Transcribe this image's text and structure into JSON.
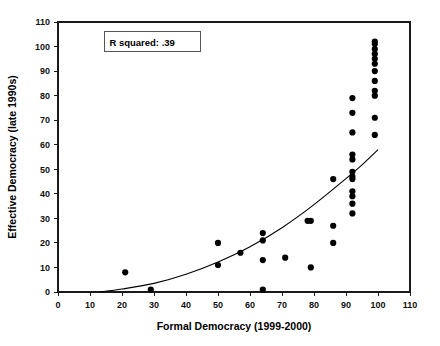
{
  "chart_data": {
    "type": "scatter",
    "title": "",
    "xlabel": "Formal Democracy (1999-2000)",
    "ylabel": "Effective Democracy (late 1990s)",
    "xlim": [
      0,
      110
    ],
    "ylim": [
      0,
      110
    ],
    "xticks": [
      0,
      10,
      20,
      30,
      40,
      50,
      60,
      70,
      80,
      90,
      100,
      110
    ],
    "yticks": [
      0,
      10,
      20,
      30,
      40,
      50,
      60,
      70,
      80,
      90,
      100,
      110
    ],
    "xtick_labels": [
      "0",
      "10",
      "20",
      "30",
      "40",
      "50",
      "60",
      "70",
      "80",
      "90",
      "100",
      "110"
    ],
    "ytick_labels": [
      "0",
      "10",
      "20",
      "30",
      "40",
      "50",
      "60",
      "70",
      "80",
      "90",
      "100",
      "110"
    ],
    "grid": false,
    "legend": null,
    "annotations": [
      {
        "id": "r-squared",
        "text": "R squared:  .39",
        "x": 17,
        "y": 102,
        "boxed": true
      }
    ],
    "series": [
      {
        "name": "Countries",
        "marker": "filled-circle",
        "color": "#000000",
        "points": [
          [
            21,
            8
          ],
          [
            29,
            1
          ],
          [
            50,
            20
          ],
          [
            50,
            11
          ],
          [
            57,
            16
          ],
          [
            64,
            24
          ],
          [
            64,
            21
          ],
          [
            64,
            13
          ],
          [
            64,
            1
          ],
          [
            71,
            14
          ],
          [
            78,
            29
          ],
          [
            79,
            29
          ],
          [
            79,
            10
          ],
          [
            86,
            46
          ],
          [
            86,
            27
          ],
          [
            86,
            20
          ],
          [
            92,
            79
          ],
          [
            92,
            73
          ],
          [
            92,
            65
          ],
          [
            92,
            56
          ],
          [
            92,
            54
          ],
          [
            92,
            49
          ],
          [
            92,
            47
          ],
          [
            92,
            46
          ],
          [
            92,
            41
          ],
          [
            92,
            39
          ],
          [
            92,
            36
          ],
          [
            92,
            32
          ],
          [
            99,
            102
          ],
          [
            99,
            101
          ],
          [
            99,
            99
          ],
          [
            99,
            97
          ],
          [
            99,
            95
          ],
          [
            99,
            93
          ],
          [
            99,
            90
          ],
          [
            99,
            86
          ],
          [
            99,
            82
          ],
          [
            99,
            80
          ],
          [
            99,
            71
          ],
          [
            99,
            64
          ]
        ]
      }
    ],
    "fit_curve": {
      "name": "Exponential fit",
      "color": "#000000",
      "points": [
        [
          13,
          0
        ],
        [
          20,
          1.2
        ],
        [
          30,
          3.5
        ],
        [
          40,
          7.2
        ],
        [
          50,
          12.2
        ],
        [
          60,
          18.4
        ],
        [
          70,
          26.2
        ],
        [
          80,
          35.6
        ],
        [
          90,
          46.2
        ],
        [
          95,
          51.8
        ],
        [
          100,
          58
        ]
      ]
    }
  }
}
